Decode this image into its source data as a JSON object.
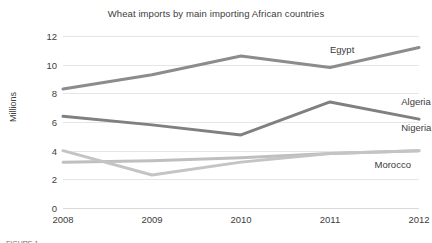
{
  "chart_data": {
    "type": "line",
    "title": "Wheat imports by main importing African countries",
    "xlabel": "",
    "ylabel": "Millions",
    "categories": [
      "2008",
      "2009",
      "2010",
      "2011",
      "2012"
    ],
    "x": [
      2008,
      2009,
      2010,
      2011,
      2012
    ],
    "ylim": [
      0,
      12
    ],
    "yticks": [
      "0",
      "2",
      "4",
      "6",
      "8",
      "10",
      "12"
    ],
    "ytick_values": [
      0,
      2,
      4,
      6,
      8,
      10,
      12
    ],
    "grid": true,
    "legend_position": "inline-right-of-lines",
    "series": [
      {
        "name": "Egypt",
        "values": [
          8.3,
          9.3,
          10.6,
          9.8,
          11.2
        ],
        "color": "#8c8c8c"
      },
      {
        "name": "Algeria",
        "values": [
          6.4,
          5.8,
          5.1,
          7.4,
          6.2
        ],
        "color": "#808080"
      },
      {
        "name": "Nigeria",
        "values": [
          3.2,
          3.3,
          3.5,
          3.8,
          4.0
        ],
        "color": "#bfbfbf"
      },
      {
        "name": "Morocco",
        "values": [
          4.0,
          2.3,
          3.2,
          3.8,
          4.0
        ],
        "color": "#c4c4c4"
      }
    ],
    "annotations": [
      {
        "text": "Egypt",
        "x": 2011.0,
        "y": 11.0
      },
      {
        "text": "Algeria",
        "x": 2011.8,
        "y": 7.4
      },
      {
        "text": "Nigeria",
        "x": 2011.8,
        "y": 5.6
      },
      {
        "text": "Morocco",
        "x": 2011.5,
        "y": 3.0
      }
    ]
  },
  "caption": {
    "partial_text": "FIGURE 1 —"
  },
  "colors": {
    "grid": "#e6e6e6",
    "text": "#3b3b3b",
    "tick_text": "#404040",
    "background": "#ffffff"
  }
}
